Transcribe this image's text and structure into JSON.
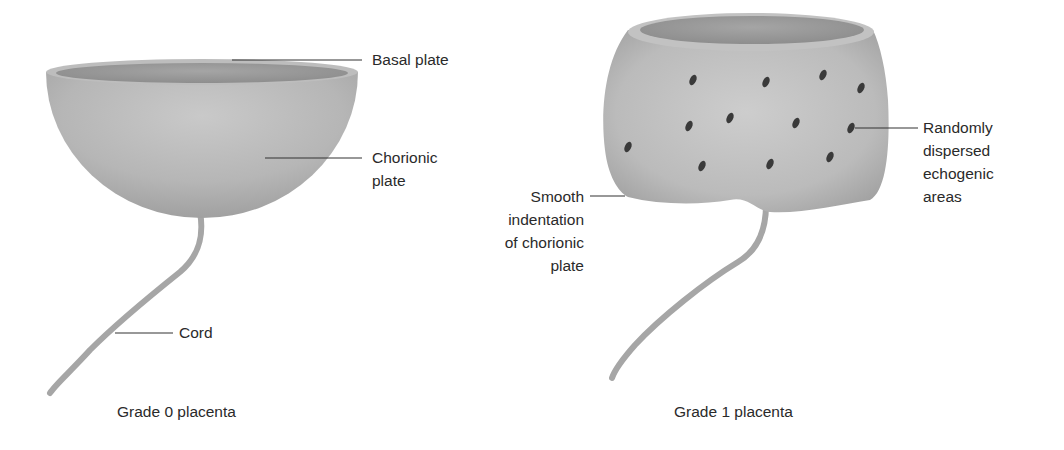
{
  "figures": [
    {
      "caption": "Grade 0 placenta",
      "labels": {
        "basal_plate": "Basal plate",
        "chorionic_plate_1": "Chorionic",
        "chorionic_plate_2": "plate",
        "cord": "Cord"
      }
    },
    {
      "caption": "Grade 1 placenta",
      "labels": {
        "echogenic_1": "Randomly",
        "echogenic_2": "dispersed",
        "echogenic_3": "echogenic",
        "echogenic_4": "areas",
        "indentation_1": "Smooth",
        "indentation_2": "indentation",
        "indentation_3": "of chorionic",
        "indentation_4": "plate"
      },
      "echogenic_dots": [
        [
          693,
          80
        ],
        [
          766,
          82
        ],
        [
          823,
          75
        ],
        [
          861,
          88
        ],
        [
          689,
          126
        ],
        [
          730,
          118
        ],
        [
          796,
          123
        ],
        [
          851,
          128
        ],
        [
          628,
          147
        ],
        [
          702,
          166
        ],
        [
          770,
          164
        ],
        [
          830,
          157
        ]
      ]
    }
  ],
  "colors": {
    "tissue": "#b5b5b5",
    "tissue_dark": "#8f8f8f",
    "dot": "#3a3a3a",
    "leader": "#333333"
  }
}
